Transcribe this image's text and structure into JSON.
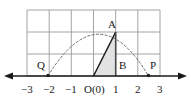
{
  "figure": {
    "colors": {
      "grid": "#9a9a9a",
      "axis": "#1a1a1a",
      "arc": "#6e6e6e",
      "segment": "#1a1a1a",
      "fill": "#e2e2e2",
      "text": "#1a1a1a",
      "background": "#ffffff"
    },
    "axis": {
      "name": "x-axis",
      "left_arrow": true,
      "right_arrow": true,
      "tick_labels": [
        {
          "text": "−3",
          "value": -3
        },
        {
          "text": "−2",
          "value": -2
        },
        {
          "text": "−1",
          "value": -1
        },
        {
          "text": "O(0)",
          "value": 0
        },
        {
          "text": "1",
          "value": 1
        },
        {
          "text": "2",
          "value": 2
        },
        {
          "text": "3",
          "value": 3
        }
      ]
    },
    "grid": {
      "x_min": -3,
      "x_max": 3,
      "y_min": 0,
      "y_max": 3,
      "cell_size": 1
    },
    "points": [
      {
        "name": "A",
        "label": "A",
        "x": 1,
        "y": 2,
        "dot": false
      },
      {
        "name": "B",
        "label": "B",
        "x": 1,
        "y": 0,
        "dot": false
      },
      {
        "name": "Q",
        "label": "Q",
        "x": -1.85,
        "y": 0,
        "dot": true
      },
      {
        "name": "P",
        "label": "P",
        "x": 2.3,
        "y": 0,
        "dot": true
      }
    ],
    "arc": {
      "name": "dashed-parabolic-arc",
      "style": "dashed",
      "start_x": -1.85,
      "end_x": 2.3,
      "apex_x": 0.25,
      "apex_y": 2.45,
      "passes_through": [
        "Q",
        "A",
        "P"
      ]
    },
    "segments": [
      {
        "name": "OA",
        "from": "O",
        "to": "A",
        "style": "solid"
      },
      {
        "name": "AB",
        "from": "A",
        "to": "B",
        "style": "solid"
      }
    ],
    "shaded_region": {
      "name": "triangle-OBA",
      "vertices": [
        "O",
        "B",
        "A"
      ],
      "fill": "light-gray"
    }
  }
}
